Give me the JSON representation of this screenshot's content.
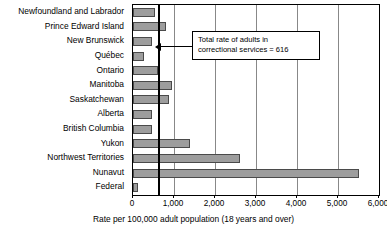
{
  "chart_data": {
    "type": "bar",
    "orientation": "horizontal",
    "title": "",
    "xlabel": "Rate per 100,000 adult population (18 years and over)",
    "ylabel": "",
    "xlim": [
      0,
      6000
    ],
    "xticks": [
      0,
      1000,
      2000,
      3000,
      4000,
      5000,
      6000
    ],
    "xtick_labels": [
      "0",
      "1,000",
      "2,000",
      "3,000",
      "4,000",
      "5,000",
      "6,000"
    ],
    "grid": true,
    "legend": "none",
    "categories": [
      "Newfoundland and Labrador",
      "Prince Edward Island",
      "New Brunswick",
      "Québec",
      "Ontario",
      "Manitoba",
      "Saskatchewan",
      "Alberta",
      "British Columbia",
      "Yukon",
      "Northwest Territories",
      "Nunavut",
      "Federal"
    ],
    "values": [
      530,
      810,
      460,
      280,
      620,
      960,
      870,
      470,
      470,
      1400,
      2600,
      5500,
      110
    ],
    "bar_color": "#9d9d9d",
    "bar_edge_color": "#4a4a4a",
    "annotations": [
      {
        "text_line1": "Total rate of adults in",
        "text_line2": "correctional services = 616",
        "value": 616,
        "reference_line": true
      }
    ]
  },
  "axis": {
    "xlabel": "Rate per 100,000 adult population (18 years and over)"
  },
  "annotation": {
    "line1": "Total rate of adults in",
    "line2": "correctional services = 616"
  }
}
